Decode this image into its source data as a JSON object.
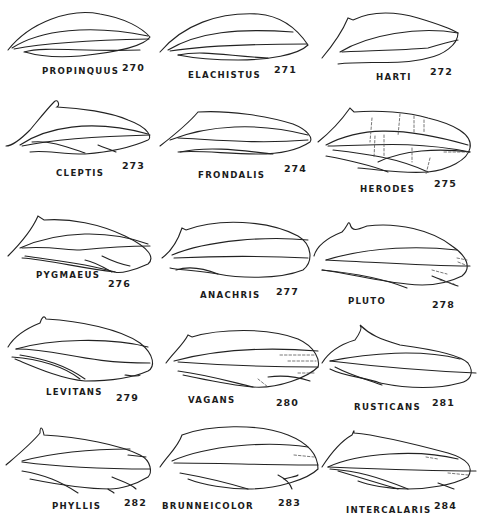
{
  "plate": {
    "figures": [
      {
        "name": "PROPINQUUS",
        "number": "270"
      },
      {
        "name": "ELACHISTUS",
        "number": "271"
      },
      {
        "name": "HARTI",
        "number": "272"
      },
      {
        "name": "CLEPTIS",
        "number": "273"
      },
      {
        "name": "FRONDALIS",
        "number": "274"
      },
      {
        "name": "HERODES",
        "number": "275"
      },
      {
        "name": "PYGMAEUS",
        "number": "276"
      },
      {
        "name": "ANACHRIS",
        "number": "277"
      },
      {
        "name": "PLUTO",
        "number": "278"
      },
      {
        "name": "LEVITANS",
        "number": "279"
      },
      {
        "name": "VAGANS",
        "number": "280"
      },
      {
        "name": "RUSTICANS",
        "number": "281"
      },
      {
        "name": "PHYLLIS",
        "number": "282"
      },
      {
        "name": "BRUNNEICOLOR",
        "number": "283"
      },
      {
        "name": "INTERCALARIS",
        "number": "284"
      }
    ]
  }
}
